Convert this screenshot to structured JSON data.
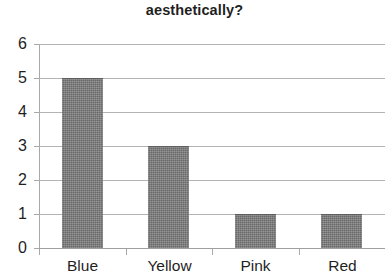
{
  "chart_data": {
    "type": "bar",
    "title": "aesthetically?",
    "title_note": "title is clipped at the top of the screenshot; only the final line is visible",
    "categories": [
      "Blue",
      "Yellow",
      "Pink",
      "Red"
    ],
    "values": [
      5,
      3,
      1,
      1
    ],
    "xlabel": "",
    "ylabel": "",
    "ylim": [
      0,
      6
    ],
    "y_ticks": [
      0,
      1,
      2,
      3,
      4,
      5,
      6
    ],
    "y_tick_labels": [
      "0",
      "1",
      "2",
      "3",
      "4",
      "5",
      "6"
    ],
    "grid": "horizontal",
    "legend": "none",
    "bar_color": "#767676",
    "gridline_color": "#b3b3b3",
    "axis_color": "#a8a8a8",
    "text_color": "#1f1f1f",
    "background": "#ffffff"
  }
}
